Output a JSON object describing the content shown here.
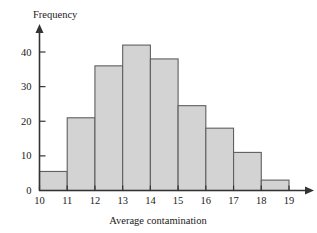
{
  "chart_data": {
    "type": "bar",
    "title": "",
    "subtitle": "",
    "xlabel": "Average contamination",
    "ylabel": "Frequency",
    "categories": [
      "10-11",
      "11-12",
      "12-13",
      "13-14",
      "14-15",
      "15-16",
      "16-17",
      "17-18",
      "18-19"
    ],
    "bin_edges": [
      10,
      11,
      12,
      13,
      14,
      15,
      16,
      17,
      18,
      19
    ],
    "values": [
      5.5,
      21,
      36,
      42,
      38,
      24.5,
      18,
      11,
      3
    ],
    "x_tick_labels": [
      "10",
      "11",
      "12",
      "13",
      "14",
      "15",
      "16",
      "17",
      "18",
      "19"
    ],
    "y_tick_labels": [
      "0",
      "10",
      "20",
      "30",
      "40"
    ],
    "y_tick_values": [
      0,
      10,
      20,
      30,
      40
    ],
    "xlim": [
      10,
      19
    ],
    "ylim": [
      0,
      44
    ],
    "grid": false,
    "legend": false,
    "bar_fill_color": "#d3d3d3",
    "bar_edge_color": "#5f5f5f",
    "axis_color": "#333333",
    "background_color": "#ffffff"
  }
}
